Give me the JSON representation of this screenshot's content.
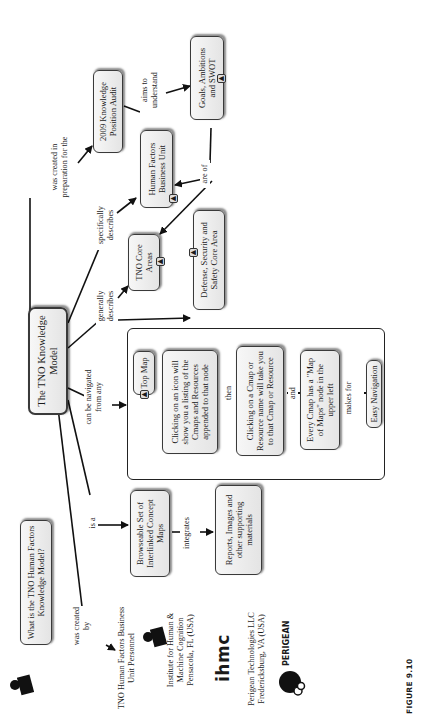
{
  "figure": {
    "caption": "FIGURE 9.10",
    "orientation": "rotated 90° counter-clockwise (text reads bottom-to-top)"
  },
  "nodes": {
    "main": "The TNO Knowledge Model",
    "question": "What is the TNO Human Factors Knowledge Model?",
    "audit": "2009 Knowledge Position Audit",
    "goals": "Goals, Ambitions and SWOT",
    "hf_unit": "Human Factors Business Unit",
    "core_areas": "TNO Core Areas",
    "defense": "Defense, Security and Safety Core Area",
    "browseable": "Browseable Set of Interlinked Concept Maps",
    "reports": "Reports, Images and other supporting materials",
    "top_map": "Top Map",
    "click_icon": "Clicking on an icon will show you a listing of the Cmaps and Resources appended to that node",
    "click_name": "Clicking on a Cmap or Resource name will take you to that Cmap or Resource",
    "map_of_maps": "Every Cmap has a \"Map of Maps\" node in the upper left",
    "easy_nav": "Easy Navigation"
  },
  "links": {
    "created_prep": "was created in preparation for the",
    "aims": "aims to understand",
    "spec_describes": "specifically describes",
    "are_of": "are of",
    "gen_describes": "generally describes",
    "navigated": "can be navigated from any",
    "then": "then",
    "and": "and",
    "makes_for": "makes for",
    "is_a": "is a",
    "integrates": "integrates",
    "created_by": "was created by"
  },
  "organizations": [
    {
      "name": "TNO Human Factors Business Unit Personnel",
      "logo": "tno-logo"
    },
    {
      "name": "Institute for Human & Machine Cognition Pensacola, FL (USA)",
      "logo": "ihmc"
    },
    {
      "name": "Perigean Technologies LLC Fredericksburg, VA (USA)",
      "logo": "PERIGEAN"
    }
  ],
  "icons": {
    "cmap_attachment": "cmap-link-icon",
    "tno_logo": "tno-logo-icon"
  },
  "colors": {
    "node_border": "#3a3a3a",
    "node_fill_top": "#f7f7f7",
    "node_fill_bottom": "#e4e4e4",
    "line": "#111111"
  }
}
